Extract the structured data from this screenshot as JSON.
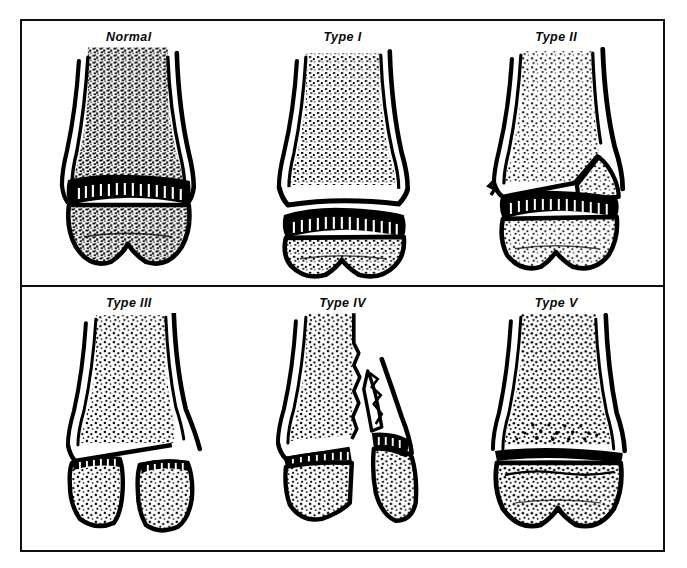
{
  "figure": {
    "border_color": "#101010",
    "ink_color": "#000000",
    "background_color": "#ffffff",
    "rows": 2,
    "columns": 3
  },
  "panels": [
    {
      "id": "normal",
      "label": "Normal",
      "row": 0,
      "column": 0,
      "illustration": "normal-distal-long-bone",
      "description": "Intact distal long bone with diaphysis, metaphysis, dark physis band and epiphysis; dense trabecular stipple throughout."
    },
    {
      "id": "type-1",
      "label": "Type I",
      "row": 0,
      "column": 1,
      "illustration": "physeal-separation",
      "description": "Clean transverse separation entirely through the physis; epiphysis displaced from metaphysis without bone fragment."
    },
    {
      "id": "type-2",
      "label": "Type II",
      "row": 0,
      "column": 2,
      "illustration": "physis-with-metaphyseal-fragment",
      "description": "Fracture through the physis exiting into the metaphysis, carrying a triangular metaphyseal fragment (Thurston Holland sign)."
    },
    {
      "id": "type-3",
      "label": "Type III",
      "row": 1,
      "column": 0,
      "illustration": "physis-with-epiphyseal-split",
      "description": "Fracture through part of the physis extending vertically through the epiphysis into the joint; epiphyseal fragment displaced."
    },
    {
      "id": "type-4",
      "label": "Type IV",
      "row": 1,
      "column": 1,
      "illustration": "metaphysis-physis-epiphysis-split",
      "description": "Fracture crossing metaphysis, physis and epiphysis as a single plane; fragment displaced laterally."
    },
    {
      "id": "type-5",
      "label": "Type V",
      "row": 1,
      "column": 2,
      "illustration": "physeal-crush",
      "description": "Crush/compression injury of the physis; growth plate narrowed to a thin compressed dark line with intact outer cortex."
    }
  ]
}
